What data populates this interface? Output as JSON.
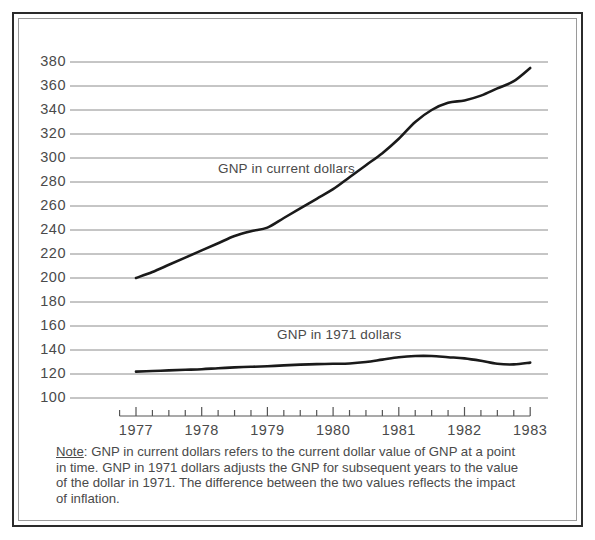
{
  "chart_data": {
    "type": "line",
    "title": "",
    "xlabel": "",
    "ylabel": "",
    "ylim": [
      100,
      380
    ],
    "xlim": [
      1976.75,
      1983.0
    ],
    "grid": true,
    "legend_position": "inline-annotation",
    "y_ticks": [
      380,
      360,
      340,
      320,
      300,
      280,
      260,
      240,
      220,
      200,
      180,
      160,
      140,
      120,
      100
    ],
    "x_ticks": [
      1977,
      1978,
      1979,
      1980,
      1981,
      1982,
      1983
    ],
    "x_minor_ticks_per_year": 4,
    "series": [
      {
        "name": "GNP in current dollars",
        "x": [
          1977.0,
          1977.25,
          1977.5,
          1977.75,
          1978.0,
          1978.25,
          1978.5,
          1978.75,
          1979.0,
          1979.25,
          1979.5,
          1979.75,
          1980.0,
          1980.25,
          1980.5,
          1980.75,
          1981.0,
          1981.25,
          1981.5,
          1981.75,
          1982.0,
          1982.25,
          1982.5,
          1982.75,
          1983.0
        ],
        "values": [
          200,
          205,
          211,
          217,
          223,
          229,
          235,
          239,
          242,
          250,
          258,
          266,
          274,
          284,
          294,
          304,
          316,
          330,
          340,
          346,
          348,
          352,
          358,
          364,
          375
        ]
      },
      {
        "name": "GNP in 1971 dollars",
        "x": [
          1977.0,
          1977.25,
          1977.5,
          1977.75,
          1978.0,
          1978.25,
          1978.5,
          1978.75,
          1979.0,
          1979.25,
          1979.5,
          1979.75,
          1980.0,
          1980.25,
          1980.5,
          1980.75,
          1981.0,
          1981.25,
          1981.5,
          1981.75,
          1982.0,
          1982.25,
          1982.5,
          1982.75,
          1983.0
        ],
        "values": [
          122,
          122.5,
          123,
          123.5,
          124,
          124.8,
          125.5,
          126,
          126.5,
          127.2,
          127.8,
          128.2,
          128.5,
          128.8,
          130,
          132,
          134,
          135,
          135,
          134,
          133,
          131,
          128.5,
          128,
          129.5
        ]
      }
    ],
    "annotations": [
      {
        "text": "GNP in current dollars",
        "x": 1978.4,
        "y": 290
      },
      {
        "text": "GNP in 1971 dollars",
        "x": 1979.3,
        "y": 152
      }
    ]
  },
  "axis": {
    "y_labels": [
      "380",
      "360",
      "340",
      "320",
      "300",
      "280",
      "260",
      "240",
      "220",
      "200",
      "180",
      "160",
      "140",
      "120",
      "100"
    ],
    "x_labels": [
      "1977",
      "1978",
      "1979",
      "1980",
      "1981",
      "1982",
      "1983"
    ]
  },
  "labels": {
    "series_current": "GNP in current dollars",
    "series_1971": "GNP in 1971 dollars"
  },
  "note": {
    "prefix": "Note",
    "colon": ":",
    "body": " GNP in current dollars refers to the current dollar value of GNP at a point in time. GNP in 1971 dollars adjusts the GNP for subsequent years to the value of the dollar in 1971. The difference between the two values reflects the impact of inflation."
  },
  "colors": {
    "frame_outer": "#2b2b2b",
    "frame_inner": "#9a9a9a",
    "gridline": "#8c8c8c",
    "series_line": "#1a1a1a",
    "text": "#4a4a4a",
    "background": "#ffffff"
  }
}
